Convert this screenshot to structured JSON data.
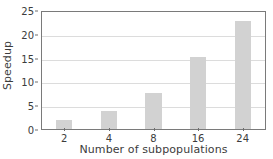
{
  "chart_data": {
    "type": "bar",
    "title": "",
    "xlabel": "Number of subpopulations",
    "ylabel": "Speedup",
    "categories": [
      "2",
      "4",
      "8",
      "16",
      "24"
    ],
    "values": [
      1.9,
      3.8,
      7.6,
      15.3,
      23.1
    ],
    "ylim": [
      0,
      25
    ],
    "yticks": [
      0,
      5,
      10,
      15,
      20,
      25
    ],
    "ytick_labels": [
      "0",
      "5",
      "10",
      "15",
      "20",
      "25"
    ],
    "xtick_labels": [
      "2",
      "4",
      "8",
      "16",
      "24"
    ],
    "grid": true,
    "grid_axis": "y",
    "legend": null,
    "bar_color": "#d2d2d2",
    "grid_color": "#dcdcdc",
    "axis_color": "#7a7a7a",
    "text_color": "#3c3c3c",
    "background": "#ffffff"
  }
}
